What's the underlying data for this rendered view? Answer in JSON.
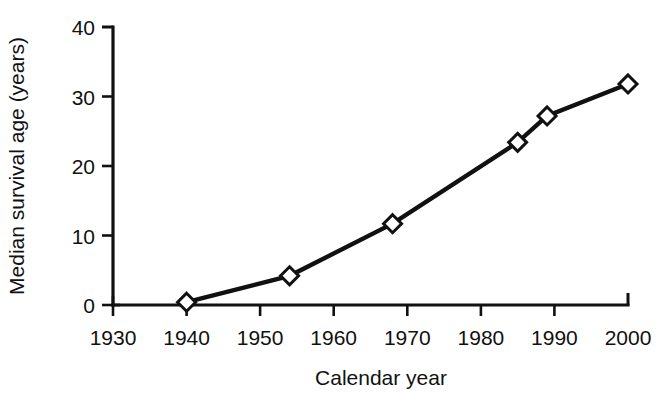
{
  "chart_data": {
    "type": "line",
    "title": "",
    "xlabel": "Calendar year",
    "ylabel": "Median survival age (years)",
    "xlim": [
      1930,
      2000
    ],
    "ylim": [
      0,
      40
    ],
    "xticks": [
      1930,
      1940,
      1950,
      1960,
      1970,
      1980,
      1990,
      2000
    ],
    "xtick_labels": [
      "1930",
      "1940",
      "1950",
      "1960",
      "1970",
      "1980",
      "1990",
      "2000"
    ],
    "yticks": [
      0,
      10,
      20,
      30,
      40
    ],
    "ytick_labels": [
      "0",
      "10",
      "20",
      "30",
      "40"
    ],
    "grid": false,
    "legend": false,
    "marker": "open-diamond",
    "line_color": "#111111",
    "marker_face_color": "#ffffff",
    "x": [
      1940,
      1954,
      1968,
      1985,
      1989,
      2000
    ],
    "values": [
      0.4,
      4.2,
      11.7,
      23.4,
      27.2,
      31.8
    ],
    "series": [
      {
        "name": "Median survival age",
        "x": [
          1940,
          1954,
          1968,
          1985,
          1989,
          2000
        ],
        "values": [
          0.4,
          4.2,
          11.7,
          23.4,
          27.2,
          31.8
        ]
      }
    ]
  }
}
